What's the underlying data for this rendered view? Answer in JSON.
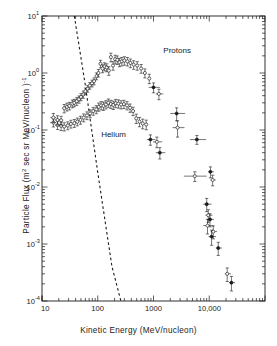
{
  "figure": {
    "title": "",
    "background": "#ffffff",
    "ink": "#1a1a1a"
  },
  "axes": {
    "xlabel": "Kinetic Energy (MeV/nucleon)",
    "ylabel_pre": "Particle Flux (m",
    "ylabel_sup1": "2",
    "ylabel_mid": " sec sr MeV/nucleon )",
    "ylabel_sup2": "-1",
    "x_ticks": [
      {
        "value": 10,
        "label": "10"
      },
      {
        "value": 100,
        "label": "100"
      },
      {
        "value": 1000,
        "label": "1000"
      },
      {
        "value": 10000,
        "label": "10,000"
      }
    ],
    "y_ticks": [
      {
        "exp": "1",
        "base": "10"
      },
      {
        "exp": "0",
        "base": "10"
      },
      {
        "exp": "-1",
        "base": "10"
      },
      {
        "exp": "-2",
        "base": "10"
      },
      {
        "exp": "-3",
        "base": "10"
      },
      {
        "exp": "-4",
        "base": "10"
      }
    ]
  },
  "annotations": [
    {
      "name": "protons-label",
      "text": "Protons"
    },
    {
      "name": "helium-label",
      "text": "Helium"
    }
  ],
  "chart_data": {
    "type": "scatter",
    "title": "",
    "xlabel": "Kinetic Energy (MeV/nucleon)",
    "ylabel": "Particle Flux (m^2 sec sr MeV/nucleon)^-1",
    "xscale": "log",
    "yscale": "log",
    "xlim": [
      10,
      100000
    ],
    "ylim": [
      0.0001,
      10
    ],
    "grid": false,
    "legend": "inline-annotations",
    "series": [
      {
        "name": "Protons",
        "marker": "open-circle",
        "points": [
          {
            "x": 16,
            "y": 0.165,
            "yerr": 0.03,
            "xerr_lo": 2,
            "xerr_hi": 2
          },
          {
            "x": 19,
            "y": 0.15,
            "yerr": 0.028,
            "xerr_lo": 2,
            "xerr_hi": 2
          },
          {
            "x": 22,
            "y": 0.148,
            "yerr": 0.026,
            "xerr_lo": 2,
            "xerr_hi": 2
          },
          {
            "x": 25,
            "y": 0.24,
            "yerr": 0.04,
            "xerr_lo": 2,
            "xerr_hi": 2
          },
          {
            "x": 28,
            "y": 0.255,
            "yerr": 0.04,
            "xerr_lo": 2,
            "xerr_hi": 2
          },
          {
            "x": 31,
            "y": 0.265,
            "yerr": 0.04,
            "xerr_lo": 2,
            "xerr_hi": 2
          },
          {
            "x": 35,
            "y": 0.29,
            "yerr": 0.045,
            "xerr_lo": 2,
            "xerr_hi": 2
          },
          {
            "x": 38,
            "y": 0.3,
            "yerr": 0.045,
            "xerr_lo": 2,
            "xerr_hi": 2
          },
          {
            "x": 42,
            "y": 0.32,
            "yerr": 0.05,
            "xerr_lo": 3,
            "xerr_hi": 3
          },
          {
            "x": 46,
            "y": 0.345,
            "yerr": 0.05,
            "xerr_lo": 3,
            "xerr_hi": 3
          },
          {
            "x": 50,
            "y": 0.38,
            "yerr": 0.055,
            "xerr_lo": 3,
            "xerr_hi": 3
          },
          {
            "x": 55,
            "y": 0.42,
            "yerr": 0.06,
            "xerr_lo": 3,
            "xerr_hi": 3
          },
          {
            "x": 60,
            "y": 0.48,
            "yerr": 0.065,
            "xerr_lo": 3,
            "xerr_hi": 3
          },
          {
            "x": 66,
            "y": 0.53,
            "yerr": 0.07,
            "xerr_lo": 3,
            "xerr_hi": 3
          },
          {
            "x": 72,
            "y": 0.6,
            "yerr": 0.08,
            "xerr_lo": 3,
            "xerr_hi": 3
          },
          {
            "x": 79,
            "y": 0.66,
            "yerr": 0.09,
            "xerr_lo": 4,
            "xerr_hi": 4
          },
          {
            "x": 86,
            "y": 0.72,
            "yerr": 0.1,
            "xerr_lo": 4,
            "xerr_hi": 4
          },
          {
            "x": 95,
            "y": 0.88,
            "yerr": 0.12,
            "xerr_lo": 4,
            "xerr_hi": 4
          },
          {
            "x": 103,
            "y": 1.0,
            "yerr": 0.15,
            "xerr_lo": 4,
            "xerr_hi": 4
          },
          {
            "x": 112,
            "y": 1.45,
            "yerr": 0.22,
            "xerr_lo": 5,
            "xerr_hi": 5
          },
          {
            "x": 122,
            "y": 1.2,
            "yerr": 0.19,
            "xerr_lo": 5,
            "xerr_hi": 5
          },
          {
            "x": 133,
            "y": 1.3,
            "yerr": 0.21,
            "xerr_lo": 5,
            "xerr_hi": 5
          },
          {
            "x": 145,
            "y": 1.25,
            "yerr": 0.2,
            "xerr_lo": 5,
            "xerr_hi": 5
          },
          {
            "x": 158,
            "y": 1.1,
            "yerr": 0.19,
            "xerr_lo": 6,
            "xerr_hi": 6
          },
          {
            "x": 172,
            "y": 1.9,
            "yerr": 0.33,
            "xerr_lo": 6,
            "xerr_hi": 6
          },
          {
            "x": 188,
            "y": 1.35,
            "yerr": 0.23,
            "xerr_lo": 6,
            "xerr_hi": 6
          },
          {
            "x": 205,
            "y": 1.75,
            "yerr": 0.3,
            "xerr_lo": 7,
            "xerr_hi": 7
          },
          {
            "x": 224,
            "y": 1.7,
            "yerr": 0.29,
            "xerr_lo": 7,
            "xerr_hi": 7
          },
          {
            "x": 245,
            "y": 1.55,
            "yerr": 0.26,
            "xerr_lo": 8,
            "xerr_hi": 8
          },
          {
            "x": 270,
            "y": 1.6,
            "yerr": 0.27,
            "xerr_lo": 9,
            "xerr_hi": 9
          },
          {
            "x": 300,
            "y": 1.65,
            "yerr": 0.28,
            "xerr_lo": 10,
            "xerr_hi": 10
          },
          {
            "x": 340,
            "y": 1.6,
            "yerr": 0.27,
            "xerr_lo": 12,
            "xerr_hi": 12
          },
          {
            "x": 385,
            "y": 1.5,
            "yerr": 0.26,
            "xerr_lo": 14,
            "xerr_hi": 14
          },
          {
            "x": 440,
            "y": 1.4,
            "yerr": 0.24,
            "xerr_lo": 18,
            "xerr_hi": 18
          },
          {
            "x": 510,
            "y": 1.35,
            "yerr": 0.23,
            "xerr_lo": 22,
            "xerr_hi": 22
          },
          {
            "x": 600,
            "y": 1.2,
            "yerr": 0.21,
            "xerr_lo": 28,
            "xerr_hi": 28
          },
          {
            "x": 700,
            "y": 1.0,
            "yerr": 0.18,
            "xerr_lo": 35,
            "xerr_hi": 35
          },
          {
            "x": 840,
            "y": 0.8,
            "yerr": 0.15,
            "xerr_lo": 45,
            "xerr_hi": 45
          },
          {
            "x": 1000,
            "y": 0.56,
            "yerr": 0.11,
            "xerr_lo": 180,
            "xerr_hi": 300
          },
          {
            "x": 1250,
            "y": 0.43,
            "yerr": 0.09,
            "xerr_lo": 150,
            "xerr_hi": 250
          },
          {
            "x": 2600,
            "y": 0.195,
            "yerr": 0.05,
            "xerr_lo": 600,
            "xerr_hi": 1100
          },
          {
            "x": 2700,
            "y": 0.11,
            "yerr": 0.035,
            "xerr_lo": 500,
            "xerr_hi": 900
          },
          {
            "x": 6000,
            "y": 0.068,
            "yerr": 0.012,
            "xerr_lo": 1500,
            "xerr_hi": 2800
          },
          {
            "x": 5500,
            "y": 0.0155,
            "yerr": 0.003,
            "xerr_lo": 2000,
            "xerr_hi": 3500
          },
          {
            "x": 10500,
            "y": 0.0185,
            "yerr": 0.004,
            "xerr_lo": 900,
            "xerr_hi": 1600
          },
          {
            "x": 11500,
            "y": 0.0133,
            "yerr": 0.0028,
            "xerr_lo": 900,
            "xerr_hi": 1600
          },
          {
            "x": 9000,
            "y": 0.005,
            "yerr": 0.0013,
            "xerr_lo": 1200,
            "xerr_hi": 2000
          },
          {
            "x": 9300,
            "y": 0.0021,
            "yerr": 0.0006,
            "xerr_lo": 1500,
            "xerr_hi": 2600
          },
          {
            "x": 11000,
            "y": 0.00135,
            "yerr": 0.0004,
            "xerr_lo": 1300,
            "xerr_hi": 2200
          }
        ]
      },
      {
        "name": "Helium",
        "marker": "open-circle",
        "points": [
          {
            "x": 16,
            "y": 0.135,
            "yerr": 0.022,
            "xerr_lo": 2,
            "xerr_hi": 2
          },
          {
            "x": 19,
            "y": 0.122,
            "yerr": 0.02,
            "xerr_lo": 2,
            "xerr_hi": 2
          },
          {
            "x": 22,
            "y": 0.118,
            "yerr": 0.02,
            "xerr_lo": 2,
            "xerr_hi": 2
          },
          {
            "x": 25,
            "y": 0.115,
            "yerr": 0.019,
            "xerr_lo": 2,
            "xerr_hi": 2
          },
          {
            "x": 29,
            "y": 0.12,
            "yerr": 0.019,
            "xerr_lo": 2,
            "xerr_hi": 2
          },
          {
            "x": 33,
            "y": 0.128,
            "yerr": 0.02,
            "xerr_lo": 2,
            "xerr_hi": 2
          },
          {
            "x": 38,
            "y": 0.132,
            "yerr": 0.021,
            "xerr_lo": 2,
            "xerr_hi": 2
          },
          {
            "x": 43,
            "y": 0.14,
            "yerr": 0.022,
            "xerr_lo": 3,
            "xerr_hi": 3
          },
          {
            "x": 49,
            "y": 0.15,
            "yerr": 0.024,
            "xerr_lo": 3,
            "xerr_hi": 3
          },
          {
            "x": 56,
            "y": 0.165,
            "yerr": 0.026,
            "xerr_lo": 3,
            "xerr_hi": 3
          },
          {
            "x": 64,
            "y": 0.18,
            "yerr": 0.028,
            "xerr_lo": 3,
            "xerr_hi": 3
          },
          {
            "x": 73,
            "y": 0.195,
            "yerr": 0.031,
            "xerr_lo": 3,
            "xerr_hi": 3
          },
          {
            "x": 83,
            "y": 0.215,
            "yerr": 0.034,
            "xerr_lo": 4,
            "xerr_hi": 4
          },
          {
            "x": 94,
            "y": 0.23,
            "yerr": 0.037,
            "xerr_lo": 4,
            "xerr_hi": 4
          },
          {
            "x": 104,
            "y": 0.255,
            "yerr": 0.042,
            "xerr_lo": 4,
            "xerr_hi": 4
          },
          {
            "x": 115,
            "y": 0.27,
            "yerr": 0.045,
            "xerr_lo": 5,
            "xerr_hi": 5
          },
          {
            "x": 127,
            "y": 0.265,
            "yerr": 0.044,
            "xerr_lo": 5,
            "xerr_hi": 5
          },
          {
            "x": 140,
            "y": 0.28,
            "yerr": 0.046,
            "xerr_lo": 5,
            "xerr_hi": 5
          },
          {
            "x": 155,
            "y": 0.3,
            "yerr": 0.05,
            "xerr_lo": 6,
            "xerr_hi": 6
          },
          {
            "x": 172,
            "y": 0.285,
            "yerr": 0.047,
            "xerr_lo": 6,
            "xerr_hi": 6
          },
          {
            "x": 190,
            "y": 0.275,
            "yerr": 0.046,
            "xerr_lo": 7,
            "xerr_hi": 7
          },
          {
            "x": 210,
            "y": 0.295,
            "yerr": 0.049,
            "xerr_lo": 7,
            "xerr_hi": 7
          },
          {
            "x": 235,
            "y": 0.29,
            "yerr": 0.048,
            "xerr_lo": 8,
            "xerr_hi": 8
          },
          {
            "x": 262,
            "y": 0.28,
            "yerr": 0.046,
            "xerr_lo": 9,
            "xerr_hi": 9
          },
          {
            "x": 295,
            "y": 0.285,
            "yerr": 0.047,
            "xerr_lo": 11,
            "xerr_hi": 11
          },
          {
            "x": 335,
            "y": 0.27,
            "yerr": 0.045,
            "xerr_lo": 13,
            "xerr_hi": 13
          },
          {
            "x": 380,
            "y": 0.245,
            "yerr": 0.041,
            "xerr_lo": 15,
            "xerr_hi": 15
          },
          {
            "x": 430,
            "y": 0.215,
            "yerr": 0.036,
            "xerr_lo": 18,
            "xerr_hi": 18
          },
          {
            "x": 490,
            "y": 0.16,
            "yerr": 0.03,
            "xerr_lo": 22,
            "xerr_hi": 22
          },
          {
            "x": 560,
            "y": 0.14,
            "yerr": 0.026,
            "xerr_lo": 26,
            "xerr_hi": 26
          },
          {
            "x": 640,
            "y": 0.13,
            "yerr": 0.025,
            "xerr_lo": 32,
            "xerr_hi": 32
          },
          {
            "x": 740,
            "y": 0.125,
            "yerr": 0.024,
            "xerr_lo": 40,
            "xerr_hi": 40
          },
          {
            "x": 880,
            "y": 0.068,
            "yerr": 0.014,
            "xerr_lo": 120,
            "xerr_hi": 200
          },
          {
            "x": 1150,
            "y": 0.062,
            "yerr": 0.013,
            "xerr_lo": 170,
            "xerr_hi": 280
          },
          {
            "x": 1300,
            "y": 0.04,
            "yerr": 0.009,
            "xerr_lo": 200,
            "xerr_hi": 330
          },
          {
            "x": 9600,
            "y": 0.0032,
            "yerr": 0.0008,
            "xerr_lo": 1100,
            "xerr_hi": 1800
          },
          {
            "x": 10300,
            "y": 0.0027,
            "yerr": 0.0007,
            "xerr_lo": 1100,
            "xerr_hi": 1800
          },
          {
            "x": 11800,
            "y": 0.00165,
            "yerr": 0.00042,
            "xerr_lo": 1200,
            "xerr_hi": 2000
          },
          {
            "x": 14500,
            "y": 0.00085,
            "yerr": 0.00022,
            "xerr_lo": 1400,
            "xerr_hi": 2400
          },
          {
            "x": 21000,
            "y": 0.0003,
            "yerr": 8e-05,
            "xerr_lo": 2000,
            "xerr_hi": 3400
          },
          {
            "x": 25000,
            "y": 0.00021,
            "yerr": 6e-05,
            "xerr_lo": 2400,
            "xerr_hi": 4000
          }
        ]
      }
    ],
    "reference_line": {
      "name": "dashed-reference-line",
      "style": "dashed",
      "points": [
        [
          38,
          10
        ],
        [
          60,
          0.6
        ],
        [
          100,
          0.018
        ],
        [
          180,
          0.0004
        ],
        [
          260,
          0.0001
        ]
      ]
    }
  }
}
